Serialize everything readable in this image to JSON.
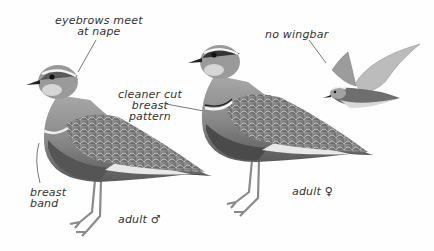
{
  "annotations": {
    "eyebrows": {
      "line1": "eyebrows meet",
      "line2": "at nape"
    },
    "breast_pattern": {
      "line1": "cleaner cut",
      "line2": "breast",
      "line3": "pattern"
    },
    "wingbar": {
      "text": "no wingbar"
    },
    "breast_band": {
      "line1": "breast",
      "line2": "band"
    }
  },
  "figures": {
    "male": {
      "caption": "adult",
      "sex_symbol": "♂"
    },
    "female": {
      "caption": "adult",
      "sex_symbol": "♀"
    },
    "flying": {
      "caption": ""
    }
  },
  "colors": {
    "background": "#fefefe",
    "body_dark": "#6a6a6a",
    "body_mid": "#8c8c8c",
    "body_light": "#b8b8b8",
    "belly_dark": "#4a4a4a",
    "line": "#444444"
  }
}
